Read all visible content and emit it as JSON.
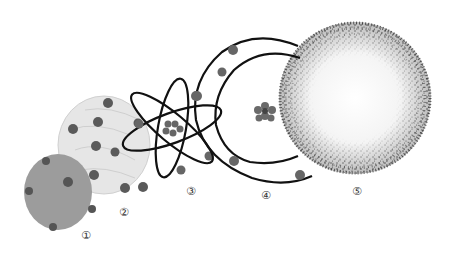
{
  "figure": {
    "labels": [
      "①",
      "②",
      "③",
      "④",
      "⑤"
    ],
    "models": [
      {
        "id": 1,
        "label": "①",
        "name": "solid sphere model",
        "fill": "#9a9a9a"
      },
      {
        "id": 2,
        "label": "②",
        "name": "plum pudding model",
        "fill": "#e4e4e4"
      },
      {
        "id": 3,
        "label": "③",
        "name": "orbital model (crossed ellipses)",
        "stroke": "#111111"
      },
      {
        "id": 4,
        "label": "④",
        "name": "shell model (concentric orbits)",
        "stroke": "#111111"
      },
      {
        "id": 5,
        "label": "⑤",
        "name": "electron cloud model",
        "dot": "#1a1a1a"
      }
    ],
    "colors": {
      "electron": "#555555",
      "nucleus": "#666666",
      "line": "#111111",
      "background": "#ffffff"
    }
  }
}
